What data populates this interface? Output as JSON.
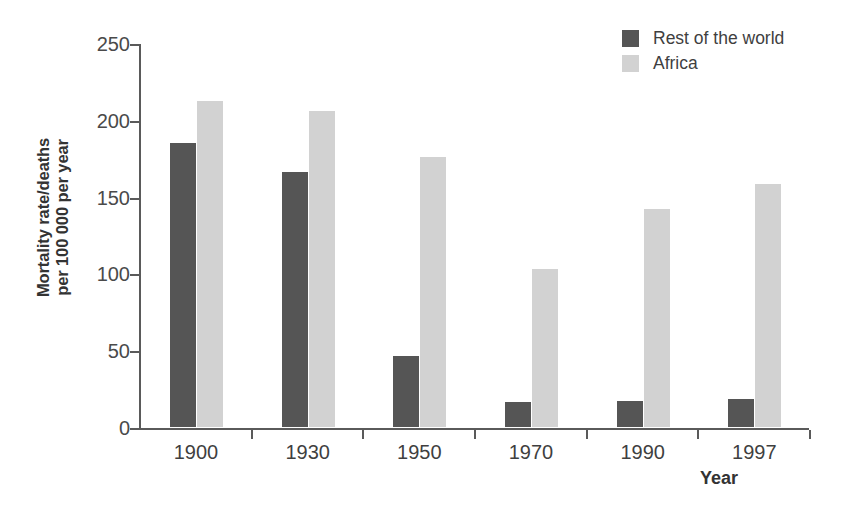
{
  "chart_data": {
    "type": "bar",
    "title": "",
    "categories": [
      "1900",
      "1930",
      "1950",
      "1970",
      "1990",
      "1997"
    ],
    "series": [
      {
        "name": "Rest of the world",
        "color": "#555555",
        "values": [
          185,
          166,
          46,
          16,
          17,
          18
        ]
      },
      {
        "name": "Africa",
        "color": "#d2d2d2",
        "values": [
          212,
          206,
          176,
          103,
          142,
          158
        ]
      }
    ],
    "xlabel": "Year",
    "ylabel": "Mortality rate/deaths per 100 000 per year",
    "ylabel_lines": [
      "Mortality rate/deaths",
      "per 100 000 per year"
    ],
    "ylim": [
      0,
      250
    ],
    "yticks": [
      0,
      50,
      100,
      150,
      200,
      250
    ],
    "ytick_labels": [
      "0",
      "50",
      "100",
      "150",
      "200",
      "250"
    ],
    "grid": false,
    "legend_position": "top-right",
    "legend": [
      "Rest of the world",
      "Africa"
    ]
  },
  "axes": {
    "y_title": "Mortality rate/deaths per 100 000 per year",
    "x_title": "Year"
  }
}
